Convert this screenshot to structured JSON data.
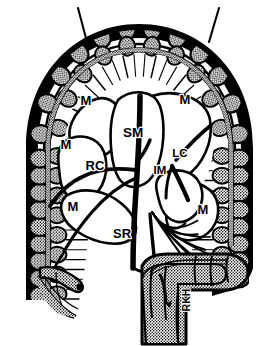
{
  "figure": {
    "kind": "anatomical line diagram",
    "style": {
      "ink": "#000000",
      "paper": "#ffffff",
      "stipple": "#000000",
      "line_weight": "variable 1-3 px"
    },
    "canvas": {
      "width": 279,
      "height": 346
    }
  },
  "labels": {
    "marginal_artery_1": {
      "text": "M",
      "x": 86,
      "y": 105
    },
    "marginal_artery_2": {
      "text": "M",
      "x": 185,
      "y": 104
    },
    "marginal_artery_3": {
      "text": "M",
      "x": 66,
      "y": 149
    },
    "marginal_artery_4": {
      "text": "M",
      "x": 73,
      "y": 211
    },
    "marginal_artery_5": {
      "text": "M",
      "x": 203,
      "y": 214
    },
    "superior_mesenteric": {
      "text": "SM",
      "x": 133,
      "y": 137
    },
    "right_colic": {
      "text": "RC",
      "x": 95,
      "y": 170
    },
    "left_colic": {
      "text": "LC",
      "x": 180,
      "y": 157
    },
    "inferior_mesenteric": {
      "text": "IM",
      "x": 160,
      "y": 174
    },
    "superior_rectal": {
      "text": "SR",
      "x": 122,
      "y": 238
    },
    "rkh": {
      "text": "RKH",
      "x": 190,
      "y": 300
    }
  },
  "legend_keys": [
    {
      "abbr": "M",
      "meaning": "M"
    },
    {
      "abbr": "SM",
      "meaning": "SM"
    },
    {
      "abbr": "RC",
      "meaning": "RC"
    },
    {
      "abbr": "LC",
      "meaning": "LC"
    },
    {
      "abbr": "IM",
      "meaning": "IM"
    },
    {
      "abbr": "SR",
      "meaning": "SR"
    },
    {
      "abbr": "RKH",
      "meaning": "RKH"
    }
  ],
  "annotations": {
    "leader_line_left": "leader-line",
    "leader_line_right": "leader-line"
  }
}
